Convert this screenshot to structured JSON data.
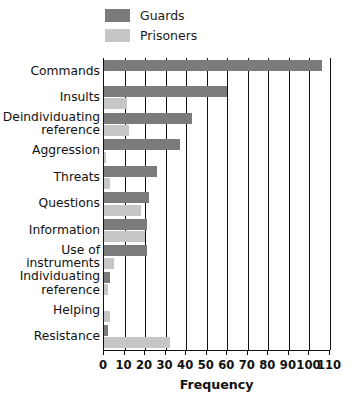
{
  "legend": {
    "position": "top-left",
    "items": [
      {
        "label": "Guards",
        "color": "#7b7b7b",
        "swatch_name": "guards-swatch"
      },
      {
        "label": "Prisoners",
        "color": "#c6c6c6",
        "swatch_name": "prisoners-swatch"
      }
    ]
  },
  "colors": {
    "guards": "#7b7b7b",
    "prisoners": "#c6c6c6",
    "axis": "#111111",
    "background": "#ffffff"
  },
  "chart_data": {
    "type": "bar",
    "orientation": "horizontal",
    "title": "",
    "subtitle": "",
    "xlabel": "Frequency",
    "ylabel": "",
    "xlim": [
      0,
      110
    ],
    "xticks": [
      0,
      10,
      20,
      30,
      40,
      50,
      60,
      70,
      80,
      90,
      100,
      110
    ],
    "xtick_labels": [
      "0",
      "10",
      "20",
      "30",
      "40",
      "50",
      "60",
      "70",
      "80",
      "90",
      "100",
      "110"
    ],
    "grid": "vertical",
    "legend_position": "top-left",
    "categories": [
      "Commands",
      "Insults",
      "Deindividuating reference",
      "Aggression",
      "Threats",
      "Questions",
      "Information",
      "Use of instruments",
      "Individuating reference",
      "Helping",
      "Resistance"
    ],
    "category_labels_display": [
      "Commands",
      "Insults",
      "Deindividuating\nreference",
      "Aggression",
      "Threats",
      "Questions",
      "Information",
      "Use of\ninstruments",
      "Individuating\nreference",
      "Helping",
      "Resistance"
    ],
    "series": [
      {
        "name": "Guards",
        "color": "#7b7b7b",
        "values": [
          106,
          60,
          43,
          37,
          26,
          22,
          21,
          21,
          3,
          0,
          2
        ]
      },
      {
        "name": "Prisoners",
        "color": "#c6c6c6",
        "values": [
          0,
          11,
          12,
          1,
          3,
          18,
          20,
          5,
          2,
          3,
          32
        ]
      }
    ]
  }
}
